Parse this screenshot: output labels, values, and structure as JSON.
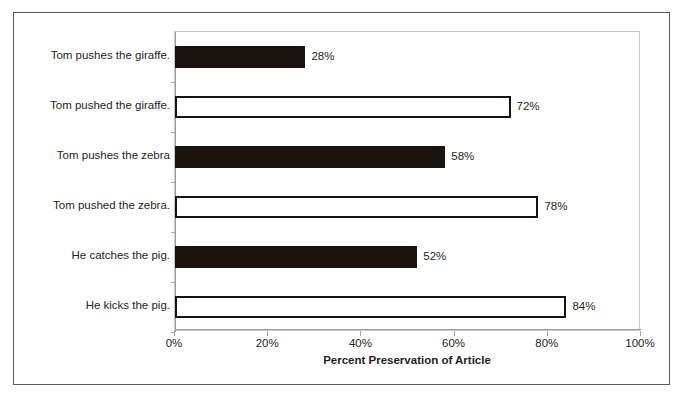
{
  "chart_data": {
    "type": "bar",
    "orientation": "horizontal",
    "title": "",
    "xlabel": "Percent Preservation of Article",
    "ylabel": "",
    "xlim": [
      0,
      100
    ],
    "x_tick_labels": [
      "0%",
      "20%",
      "40%",
      "60%",
      "80%",
      "100%"
    ],
    "x_ticks": [
      0,
      20,
      40,
      60,
      80,
      100
    ],
    "grid": false,
    "legend": null,
    "categories": [
      "Tom pushes the giraffe.",
      "Tom pushed the giraffe.",
      "Tom pushes the zebra",
      "Tom pushed the zebra.",
      "He catches the pig.",
      "He kicks the pig."
    ],
    "values": [
      28,
      72,
      58,
      78,
      52,
      84
    ],
    "value_labels": [
      "28%",
      "72%",
      "58%",
      "78%",
      "52%",
      "84%"
    ],
    "bar_styles": [
      "filled",
      "hollow",
      "filled",
      "hollow",
      "filled",
      "hollow"
    ],
    "colors": {
      "filled_bar": "#1a1411",
      "hollow_bar_fill": "#ffffff",
      "hollow_bar_border": "#171210",
      "axis": "#9a9a9a",
      "text": "#231f20",
      "plot_border": "#c8c8c8",
      "figure_border": "#5a5a5a",
      "background": "#ffffff"
    }
  }
}
